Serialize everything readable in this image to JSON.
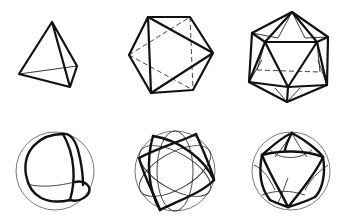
{
  "figure": {
    "polyhedra": [
      {
        "name": "tetrahedron",
        "row": "top",
        "column": 1
      },
      {
        "name": "octahedron",
        "row": "top",
        "column": 2
      },
      {
        "name": "icosahedron",
        "row": "top",
        "column": 3
      }
    ],
    "spheres": [
      {
        "name": "spherical-tetrahedron",
        "row": "bottom",
        "column": 1
      },
      {
        "name": "spherical-octahedron",
        "row": "bottom",
        "column": 2
      },
      {
        "name": "spherical-icosahedron",
        "row": "bottom",
        "column": 3
      }
    ],
    "colors": {
      "line": "#111111",
      "background": "#ffffff"
    }
  }
}
